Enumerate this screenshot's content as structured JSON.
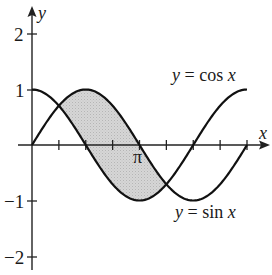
{
  "chart_data": {
    "type": "line",
    "title": "",
    "xlabel": "x",
    "ylabel": "y",
    "xlim": [
      0,
      6.8
    ],
    "ylim": [
      -2.1,
      2.3
    ],
    "x_ticks": [
      0.7854,
      1.5708,
      2.3562,
      3.1416,
      3.927,
      4.7124,
      5.4978,
      6.2832
    ],
    "x_tick_labels": [
      "",
      "",
      "",
      "π",
      "",
      "",
      "",
      ""
    ],
    "y_ticks": [
      -2,
      -1,
      1,
      2
    ],
    "y_tick_labels": [
      "−2",
      "−1",
      "1",
      "2"
    ],
    "grid": false,
    "series": [
      {
        "name": "y = cos x",
        "function": "cos",
        "domain": [
          0,
          6.2832
        ]
      },
      {
        "name": "y = sin x",
        "function": "sin",
        "domain": [
          0,
          6.2832
        ]
      }
    ],
    "shaded_region": {
      "between": [
        "sin",
        "cos"
      ],
      "x_from": 0.7854,
      "x_to": 3.927,
      "fill": "#cfcfcf"
    },
    "annotations": [
      {
        "text": "y = cos x",
        "near": "cos curve, upper right"
      },
      {
        "text": "y = sin x",
        "near": "sin curve, lower right"
      },
      {
        "text": "π",
        "near": "x-axis tick at π"
      }
    ]
  },
  "labels": {
    "x_axis": "x",
    "y_axis": "y",
    "pi": "π",
    "y2": "2",
    "y1": "1",
    "yneg1": "−1",
    "yneg2": "−2",
    "cos_eq_y": "y",
    "cos_eq_rest": " = cos ",
    "cos_eq_x": "x",
    "sin_eq_y": "y",
    "sin_eq_rest": " = sin ",
    "sin_eq_x": "x"
  },
  "colors": {
    "curve": "#111111",
    "axis": "#222222",
    "fill": "#cfcfcf"
  }
}
